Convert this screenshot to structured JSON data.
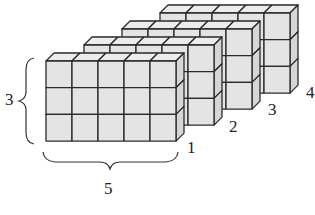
{
  "figure": {
    "layers": [
      {
        "label": "1",
        "columns": 5,
        "rows": 3
      },
      {
        "label": "2",
        "columns": 5,
        "rows": 3
      },
      {
        "label": "3",
        "columns": 5,
        "rows": 3
      },
      {
        "label": "4",
        "columns": 5,
        "rows": 3
      }
    ],
    "height_label": "3",
    "width_label": "5",
    "colors": {
      "face": "#e4e4e4",
      "top": "#ececec",
      "side": "#d6d6d6",
      "edge": "#2a2a2a"
    }
  }
}
